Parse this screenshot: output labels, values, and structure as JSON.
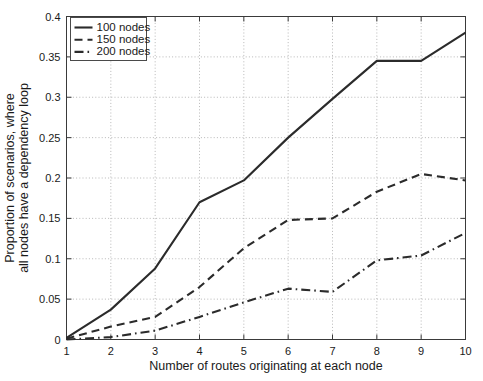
{
  "chart_data": {
    "type": "line",
    "title": "",
    "xlabel": "Number of routes originating at each node",
    "ylabel_line1": "Proportion of scenarios, where",
    "ylabel_line2": "all nodes have a dependency loop",
    "x": [
      1,
      2,
      3,
      4,
      5,
      6,
      7,
      8,
      9,
      10
    ],
    "xlim": [
      1,
      10
    ],
    "ylim": [
      0,
      0.4
    ],
    "xticks": [
      "1",
      "2",
      "3",
      "4",
      "5",
      "6",
      "7",
      "8",
      "9",
      "10"
    ],
    "yticks": [
      "0",
      "0.05",
      "0.1",
      "0.15",
      "0.2",
      "0.25",
      "0.3",
      "0.35",
      "0.4"
    ],
    "ytick_values": [
      0,
      0.05,
      0.1,
      0.15,
      0.2,
      0.25,
      0.3,
      0.35,
      0.4
    ],
    "grid": true,
    "legend_position": "top-left",
    "series": [
      {
        "name": "100 nodes",
        "style": "solid",
        "color": "#2b2b2b",
        "values": [
          0.002,
          0.037,
          0.088,
          0.17,
          0.197,
          0.25,
          0.298,
          0.345,
          0.345,
          0.38
        ]
      },
      {
        "name": "150 nodes",
        "style": "dashed",
        "color": "#2b2b2b",
        "values": [
          0.001,
          0.016,
          0.028,
          0.065,
          0.113,
          0.148,
          0.15,
          0.183,
          0.205,
          0.197
        ]
      },
      {
        "name": "200 nodes",
        "style": "dashdot",
        "color": "#2b2b2b",
        "values": [
          0.0,
          0.003,
          0.011,
          0.028,
          0.046,
          0.063,
          0.059,
          0.098,
          0.104,
          0.132
        ]
      }
    ]
  },
  "legend": {
    "items": [
      {
        "label": "100 nodes",
        "style": "solid"
      },
      {
        "label": "150 nodes",
        "style": "dashed"
      },
      {
        "label": "200 nodes",
        "style": "dashdot"
      }
    ]
  },
  "colors": {
    "background": "#ffffff",
    "axis": "#3a3a3a",
    "grid": "#9a9a9a",
    "line": "#2b2b2b",
    "text": "#1a1a1a"
  }
}
